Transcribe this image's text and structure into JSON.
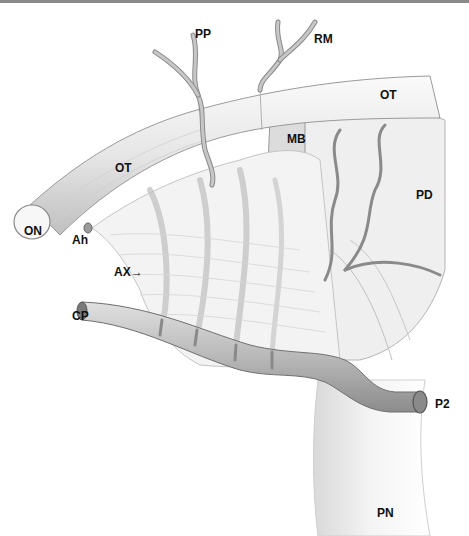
{
  "figure": {
    "type": "anatomical-illustration",
    "labels": [
      {
        "id": "PP",
        "text": "PP",
        "x": 195,
        "y": 28
      },
      {
        "id": "RM",
        "text": "RM",
        "x": 314,
        "y": 33
      },
      {
        "id": "OT_right",
        "text": "OT",
        "x": 380,
        "y": 89
      },
      {
        "id": "MB",
        "text": "MB",
        "x": 287,
        "y": 133
      },
      {
        "id": "OT_left",
        "text": "OT",
        "x": 115,
        "y": 162
      },
      {
        "id": "PD",
        "text": "PD",
        "x": 416,
        "y": 189
      },
      {
        "id": "ON",
        "text": "ON",
        "x": 24,
        "y": 225
      },
      {
        "id": "Ah",
        "text": "Ah",
        "x": 72,
        "y": 234
      },
      {
        "id": "AX",
        "text": "AX→",
        "x": 114,
        "y": 266
      },
      {
        "id": "CP",
        "text": "CP",
        "x": 72,
        "y": 310
      },
      {
        "id": "P2",
        "text": "P2",
        "x": 435,
        "y": 398
      },
      {
        "id": "PN",
        "text": "PN",
        "x": 377,
        "y": 507
      }
    ],
    "colors": {
      "background": "#ffffff",
      "top_rule": "#8a8a8a",
      "structure_fill": "#eeeeee",
      "structure_stroke": "#9a9a9a",
      "vessel_fill": "#bdbdbd",
      "vessel_stroke": "#7a7a7a",
      "label": "#111111"
    }
  }
}
